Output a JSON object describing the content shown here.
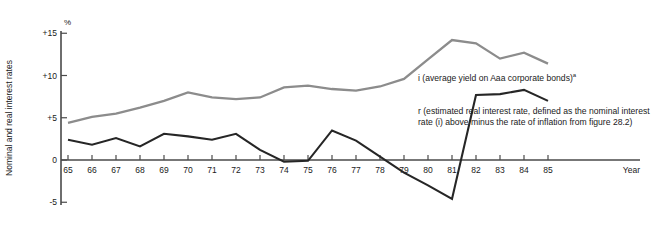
{
  "axes": {
    "y_axis_title": "Nominal and real interest rates",
    "y_unit_label": "%",
    "x_axis_title": "Year",
    "y_ticks": [
      "+15",
      "+10",
      "+5",
      "0",
      "-5"
    ],
    "x_ticks": [
      "65",
      "66",
      "67",
      "68",
      "69",
      "70",
      "71",
      "72",
      "73",
      "74",
      "75",
      "76",
      "77",
      "78",
      "79",
      "80",
      "81",
      "82",
      "83",
      "84",
      "85"
    ]
  },
  "annotations": {
    "nominal": "i (average yield on Aaa corporate bonds)",
    "nominal_superscript": "a",
    "real": "r (estimated real interest rate, defined as the nominal interest rate (i) above minus the rate of inflation from figure 28.2)"
  },
  "colors": {
    "nominal_line": "#8c8c8c",
    "real_line": "#262626",
    "axis": "#4a4a4a",
    "background": "#ffffff"
  },
  "chart_data": {
    "type": "line",
    "title": "",
    "xlabel": "Year",
    "ylabel": "Nominal and real interest rates",
    "yunit": "%",
    "xlim": [
      1965,
      1985
    ],
    "ylim": [
      -5,
      15
    ],
    "grid": false,
    "legend_position": "inline-annotation",
    "x": [
      1965,
      1966,
      1967,
      1968,
      1969,
      1970,
      1971,
      1972,
      1973,
      1974,
      1975,
      1976,
      1977,
      1978,
      1979,
      1980,
      1981,
      1982,
      1983,
      1984,
      1985
    ],
    "categories": [
      "65",
      "66",
      "67",
      "68",
      "69",
      "70",
      "71",
      "72",
      "73",
      "74",
      "75",
      "76",
      "77",
      "78",
      "79",
      "80",
      "81",
      "82",
      "83",
      "84",
      "85"
    ],
    "series": [
      {
        "name": "i (average yield on Aaa corporate bonds)",
        "color": "#8c8c8c",
        "values": [
          4.4,
          5.1,
          5.5,
          6.2,
          7.0,
          8.0,
          7.4,
          7.2,
          7.4,
          8.6,
          8.8,
          8.4,
          8.2,
          8.7,
          9.6,
          11.9,
          14.2,
          13.8,
          12.0,
          12.7,
          11.4
        ]
      },
      {
        "name": "r (estimated real interest rate)",
        "color": "#262626",
        "values": [
          2.4,
          1.8,
          2.6,
          1.6,
          3.1,
          2.8,
          2.4,
          3.1,
          1.2,
          -0.2,
          -0.1,
          3.5,
          2.3,
          0.4,
          -1.5,
          -3.0,
          -4.6,
          7.7,
          7.8,
          8.3,
          7.0
        ]
      }
    ]
  }
}
